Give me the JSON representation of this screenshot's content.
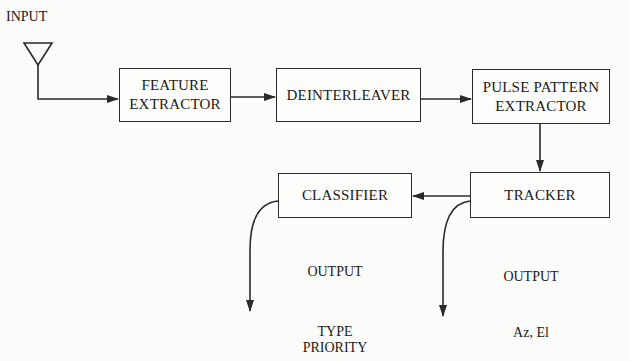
{
  "input_label": "INPUT",
  "blocks": {
    "feature_extractor": [
      "FEATURE",
      "EXTRACTOR"
    ],
    "deinterleaver": [
      "DEINTERLEAVER"
    ],
    "pulse_pattern_extractor": [
      "PULSE PATTERN",
      "EXTRACTOR"
    ],
    "tracker": [
      "TRACKER"
    ],
    "classifier": [
      "CLASSIFIER"
    ]
  },
  "outputs": {
    "classifier": {
      "heading": "OUTPUT",
      "values": [
        "TYPE",
        "PRIORITY"
      ]
    },
    "tracker": {
      "heading": "OUTPUT",
      "values": [
        "Az, El"
      ]
    }
  },
  "colors": {
    "line": "#2a2a2a",
    "background": "#fbfbf9"
  }
}
